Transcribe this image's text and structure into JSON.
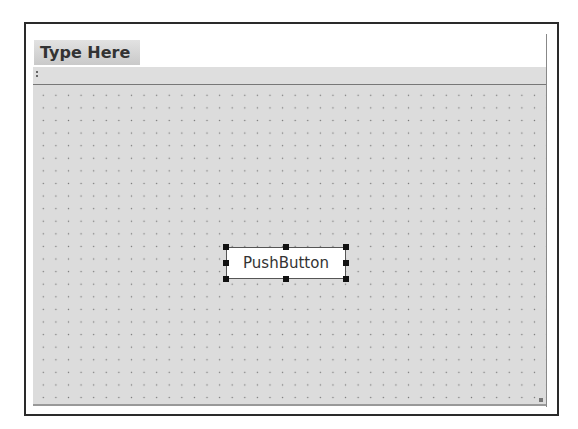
{
  "menubar": {
    "placeholder_item": "Type Here"
  },
  "form": {
    "widgets": [
      {
        "type": "PushButton",
        "label": "PushButton",
        "selected": true
      }
    ]
  },
  "colors": {
    "form_bg": "#dcdcdc",
    "frame": "#2a2a2a",
    "handle": "#111111"
  }
}
